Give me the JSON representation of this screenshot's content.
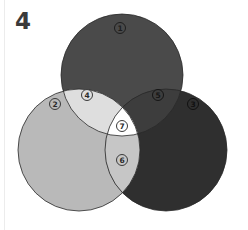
{
  "figure": {
    "number": "4"
  },
  "venn": {
    "circles": [
      {
        "id": "1",
        "name": "top",
        "cx": 122,
        "cy": 75,
        "r": 61,
        "color": "#4a4a4a"
      },
      {
        "id": "2",
        "name": "left",
        "cx": 79,
        "cy": 150,
        "r": 61,
        "color": "#b9b9b9"
      },
      {
        "id": "3",
        "name": "right",
        "cx": 166,
        "cy": 150,
        "r": 61,
        "color": "#2f2f2f"
      }
    ],
    "regions": {
      "r4": {
        "label": "4",
        "color": "#dedede",
        "sets": [
          "1",
          "2"
        ]
      },
      "r5": {
        "label": "5",
        "color": "#3d3d3d",
        "sets": [
          "1",
          "3"
        ]
      },
      "r6": {
        "label": "6",
        "color": "#c6c6c6",
        "sets": [
          "2",
          "3"
        ]
      },
      "r7": {
        "label": "7",
        "color": "#ffffff",
        "sets": [
          "1",
          "2",
          "3"
        ]
      }
    },
    "labels": [
      {
        "text": "1",
        "x": 120,
        "y": 28,
        "fill": "#4a4a4a",
        "stroke": "#1e1e1e",
        "textColor": "#1e1e1e"
      },
      {
        "text": "2",
        "x": 55,
        "y": 104,
        "fill": "#b9b9b9",
        "stroke": "#3a3a3a",
        "textColor": "#2a2a2a"
      },
      {
        "text": "3",
        "x": 193,
        "y": 104,
        "fill": "#2f2f2f",
        "stroke": "#111111",
        "textColor": "#111111"
      },
      {
        "text": "4",
        "x": 87,
        "y": 95,
        "fill": "#dedede",
        "stroke": "#3a3a3a",
        "textColor": "#2a2a2a"
      },
      {
        "text": "5",
        "x": 158,
        "y": 95,
        "fill": "#3d3d3d",
        "stroke": "#151515",
        "textColor": "#151515"
      },
      {
        "text": "6",
        "x": 122,
        "y": 160,
        "fill": "#c6c6c6",
        "stroke": "#3a3a3a",
        "textColor": "#2a2a2a"
      },
      {
        "text": "7",
        "x": 122,
        "y": 126,
        "fill": "#ffffff",
        "stroke": "#3a3a3a",
        "textColor": "#2a2a2a"
      }
    ],
    "outline_color": "#2a2a2a"
  }
}
